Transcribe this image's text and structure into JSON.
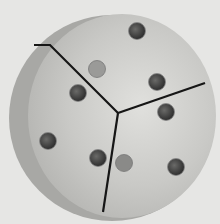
{
  "image": {
    "subject": "three-jaw chuck face plate, split into three segments with bolt holes",
    "background_color": "#e2e2e0",
    "disc_color": "#cfcfcc",
    "rim_color": "#a9a9a6",
    "slot_color": "#1a1a1a",
    "hole_color": "#3a3a3a",
    "holes": [
      {
        "cx": 137,
        "cy": 30,
        "r": 9
      },
      {
        "cx": 97,
        "cy": 68,
        "r": 9
      },
      {
        "cx": 157,
        "cy": 82,
        "r": 9
      },
      {
        "cx": 78,
        "cy": 93,
        "r": 9
      },
      {
        "cx": 166,
        "cy": 112,
        "r": 9
      },
      {
        "cx": 48,
        "cy": 140,
        "r": 9
      },
      {
        "cx": 98,
        "cy": 158,
        "r": 9
      },
      {
        "cx": 125,
        "cy": 163,
        "r": 9
      },
      {
        "cx": 176,
        "cy": 167,
        "r": 9
      }
    ]
  }
}
